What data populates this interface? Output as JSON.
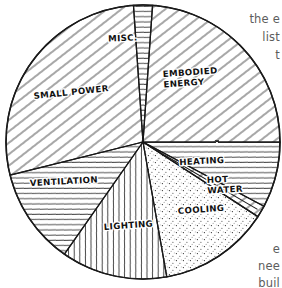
{
  "figure": {
    "name": "building-energy-use-pie-chart",
    "style": "hand-drawn sketch, black ink on white paper",
    "outline_color": "#1a1a1a",
    "text_color": "#111111",
    "margin_text_color": "#5d5d5d"
  },
  "chart_data": {
    "type": "pie",
    "title": "",
    "xlabel": "",
    "ylabel": "",
    "legend_position": "none",
    "grid": false,
    "labels_inline": true,
    "center": [
      143,
      142
    ],
    "radius": 137,
    "categories": [
      "MISC.",
      "EMBODIED ENERGY",
      "HEATING",
      "HOT WATER",
      "COOLING",
      "LIGHTING",
      "VENTILATION",
      "SMALL POWER"
    ],
    "values": [
      2.2,
      23.9,
      7.8,
      1.4,
      13.1,
      12.5,
      11.4,
      27.7
    ],
    "slices": [
      {
        "label": "MISC.",
        "value": 2.2,
        "start_angle": -94,
        "end_angle": -86,
        "hatch": "horizontal",
        "label_x": 123,
        "label_y": 41,
        "label_rotation": -2,
        "label_anchor": "middle"
      },
      {
        "label": "EMBODIED ENERGY",
        "value": 23.9,
        "start_angle": -86,
        "end_angle": 0,
        "hatch": "diagonal-down",
        "label_x": 163,
        "label_y": 77,
        "label_rotation": -4,
        "label_anchor": "start",
        "label_lines": [
          "EMBODIED",
          "ENERGY"
        ]
      },
      {
        "label": "HEATING",
        "value": 7.8,
        "start_angle": 0,
        "end_angle": 28,
        "hatch": "horizontal",
        "label_x": 202,
        "label_y": 164,
        "label_rotation": -3,
        "label_anchor": "middle"
      },
      {
        "label": "HOT WATER",
        "value": 1.4,
        "start_angle": 28,
        "end_angle": 33,
        "hatch": "diagonal-down",
        "label_x": 207,
        "label_y": 183,
        "label_rotation": -3,
        "label_anchor": "start",
        "label_lines": [
          "HOT",
          "WATER"
        ],
        "leader": true
      },
      {
        "label": "COOLING",
        "value": 13.1,
        "start_angle": 33,
        "end_angle": 80,
        "hatch": "stipple",
        "label_x": 178,
        "label_y": 214,
        "label_rotation": -4,
        "label_anchor": "start"
      },
      {
        "label": "LIGHTING",
        "value": 12.5,
        "start_angle": 80,
        "end_angle": 125,
        "hatch": "vertical",
        "label_x": 104,
        "label_y": 230,
        "label_rotation": -4,
        "label_anchor": "start"
      },
      {
        "label": "VENTILATION",
        "value": 11.4,
        "start_angle": 125,
        "end_angle": 166,
        "hatch": "horizontal",
        "label_x": 30,
        "label_y": 186,
        "label_rotation": -3,
        "label_anchor": "start"
      },
      {
        "label": "SMALL POWER",
        "value": 27.7,
        "start_angle": 166,
        "end_angle": 266,
        "hatch": "diagonal-down",
        "label_x": 34,
        "label_y": 99,
        "label_rotation": -6,
        "label_anchor": "start"
      }
    ]
  },
  "margin_text": {
    "lines": [
      {
        "text": "the e",
        "top": 12
      },
      {
        "text": "list",
        "top": 30
      },
      {
        "text": "t",
        "top": 48
      },
      {
        "text": "e",
        "top": 242
      },
      {
        "text": "nee",
        "top": 259
      },
      {
        "text": "buil",
        "top": 276
      }
    ]
  }
}
